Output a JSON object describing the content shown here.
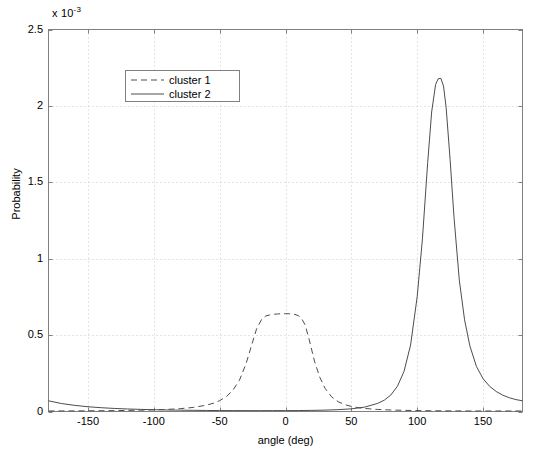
{
  "figure": {
    "exponent_label": "x 10",
    "exponent_power": "-3",
    "xlabel": "angle (deg)",
    "ylabel": "Probability",
    "background_color": "#ffffff",
    "axis_color": "#808080",
    "grid_color": "#c8c8c8",
    "line_color": "#4d4d4d"
  },
  "legend": {
    "entries": [
      {
        "label": "cluster 1",
        "style": "dashed"
      },
      {
        "label": "cluster 2",
        "style": "solid"
      }
    ]
  },
  "chart_data": {
    "type": "line",
    "title": "",
    "xlabel": "angle (deg)",
    "ylabel": "Probability",
    "xlim": [
      -180,
      180
    ],
    "ylim": [
      0,
      0.0025
    ],
    "yscale_multiplier": "x 10^-3",
    "grid": true,
    "legend_position": "upper center",
    "xticks": [
      -150,
      -100,
      -50,
      0,
      50,
      100,
      150
    ],
    "xtick_labels": [
      "-150",
      "-100",
      "-50",
      "0",
      "50",
      "100",
      "150"
    ],
    "yticks": [
      0,
      0.0005,
      0.001,
      0.0015,
      0.002,
      0.0025
    ],
    "ytick_labels": [
      "0",
      "0.5",
      "1",
      "1.5",
      "2",
      "2.5"
    ],
    "series": [
      {
        "name": "cluster 1",
        "style": "dashed",
        "peak_x": 2,
        "peak_y": 0.00064,
        "x": [
          -180,
          -170,
          -160,
          -150,
          -140,
          -130,
          -120,
          -110,
          -100,
          -90,
          -80,
          -70,
          -60,
          -55,
          -50,
          -45,
          -40,
          -35,
          -30,
          -26,
          -22,
          -18,
          -15,
          -12,
          -10,
          -8,
          -6,
          -4,
          -2,
          0,
          2,
          4,
          6,
          8,
          10,
          12,
          15,
          18,
          22,
          26,
          30,
          35,
          40,
          45,
          50,
          55,
          60,
          70,
          80,
          90,
          100,
          110,
          120,
          130,
          140,
          150,
          160,
          170,
          180
        ],
        "y": [
          3.5e-06,
          3.7e-06,
          4e-06,
          4.5e-06,
          5.1e-06,
          5.9e-06,
          7e-06,
          8.5e-06,
          1.06e-05,
          1.37e-05,
          1.86e-05,
          2.67e-05,
          4.17e-05,
          5.35e-05,
          7.1e-05,
          9.74e-05,
          0.0001385,
          0.0002044,
          0.0003118,
          0.0004262,
          0.0005395,
          0.000605,
          0.000625,
          0.000632,
          0.000635,
          0.000637,
          0.0006385,
          0.0006395,
          0.00064,
          0.0006398,
          0.00064,
          0.000639,
          0.000637,
          0.000633,
          0.000626,
          0.000612,
          0.000565,
          0.00047,
          0.00033,
          0.000225,
          0.000152,
          9.6e-05,
          6.4e-05,
          4.5e-05,
          3.3e-05,
          2.53e-05,
          2e-05,
          1.35e-05,
          9.8e-06,
          7.5e-06,
          6e-06,
          5e-06,
          4.3e-06,
          3.9e-06,
          3.6e-06,
          3.5e-06,
          3.4e-06,
          3.4e-06,
          3.5e-06
        ],
        "note": "narrow peak centred near 0 deg, tails decay to ~0 beyond +/-60 deg"
      },
      {
        "name": "cluster 2",
        "style": "solid",
        "peak_x": 118,
        "peak_y": 0.00218,
        "x": [
          -180,
          -170,
          -160,
          -150,
          -140,
          -130,
          -120,
          -110,
          -100,
          -90,
          -80,
          -70,
          -60,
          -50,
          -40,
          -30,
          -20,
          -10,
          0,
          10,
          20,
          30,
          40,
          50,
          60,
          70,
          75,
          80,
          85,
          90,
          95,
          100,
          104,
          108,
          111,
          114,
          116,
          118,
          120,
          122,
          125,
          128,
          132,
          136,
          140,
          145,
          150,
          155,
          160,
          165,
          170,
          175,
          180
        ],
        "y": [
          7e-05,
          5.2e-05,
          4e-05,
          3.1e-05,
          2.48e-05,
          2e-05,
          1.65e-05,
          1.38e-05,
          1.17e-05,
          1e-05,
          8.7e-06,
          7.6e-06,
          6.8e-06,
          6.2e-06,
          5.8e-06,
          5.6e-06,
          5.5e-06,
          5.6e-06,
          5.8e-06,
          6.3e-06,
          7.3e-06,
          9e-06,
          1.2e-05,
          1.75e-05,
          2.85e-05,
          5.3e-05,
          7.4e-05,
          0.000108,
          0.000165,
          0.000262,
          0.000435,
          0.00075,
          0.00113,
          0.00163,
          0.00196,
          0.00214,
          0.002178,
          0.00218,
          0.00213,
          0.00199,
          0.00165,
          0.00127,
          0.00086,
          0.0006,
          0.00043,
          0.000295,
          0.000215,
          0.000165,
          0.000131,
          0.000107,
          9e-05,
          7.8e-05,
          7e-05
        ],
        "note": "tall sharp peak at about 118 deg, heavy tails wrapping around +/-180 deg"
      }
    ]
  }
}
